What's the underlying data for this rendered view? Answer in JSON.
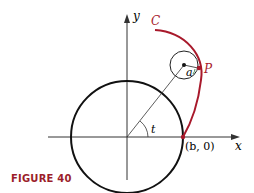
{
  "figure": {
    "caption": "FIGURE 40",
    "caption_color": "#9b1d2a",
    "curve_color": "#a8192b",
    "labels": {
      "y_axis": "y",
      "x_axis": "x",
      "curve": "C",
      "point": "P",
      "radius": "a",
      "angle": "t",
      "point_b": "(b, 0)"
    }
  }
}
